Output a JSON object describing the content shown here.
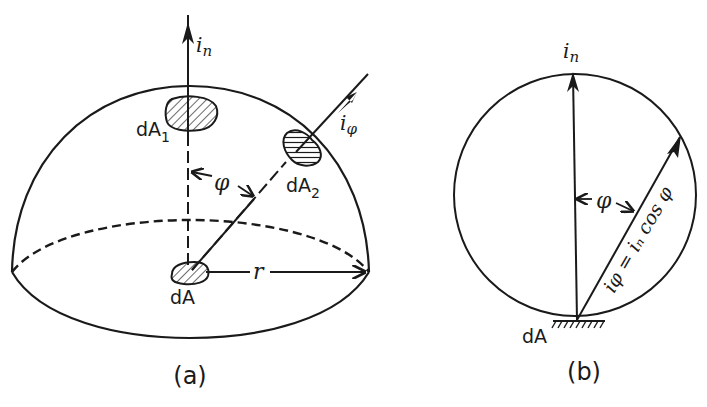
{
  "figure": {
    "panel_a": {
      "caption": "(a)",
      "labels": {
        "normal_intensity": "i",
        "normal_intensity_sub": "n",
        "angle_intensity": "i",
        "angle_intensity_sub": "φ",
        "area_1": "dA",
        "area_1_sub": "1",
        "area_2": "dA",
        "area_2_sub": "2",
        "area_center": "dA",
        "angle": "φ",
        "radius": "r"
      }
    },
    "panel_b": {
      "caption": "(b)",
      "labels": {
        "normal_intensity": "i",
        "normal_intensity_sub": "n",
        "angle": "φ",
        "relation": "iφ = iₙ cos φ",
        "area": "dA"
      }
    },
    "colors": {
      "stroke": "#1a1a1a",
      "background": "#ffffff"
    }
  }
}
